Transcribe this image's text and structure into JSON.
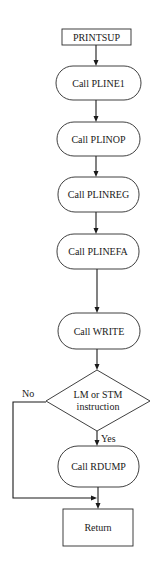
{
  "diagram": {
    "type": "flowchart",
    "nodes": {
      "start": {
        "label": "PRINTSUP",
        "shape": "rectangle"
      },
      "pline1": {
        "label": "Call PLINE1",
        "shape": "rounded"
      },
      "plinop": {
        "label": "Call PLINOP",
        "shape": "rounded"
      },
      "plinreg": {
        "label": "Call PLINREG",
        "shape": "rounded"
      },
      "plinefa": {
        "label": "Call PLINEFA",
        "shape": "rounded"
      },
      "write": {
        "label": "Call WRITE",
        "shape": "rounded"
      },
      "decision": {
        "label_line1": "LM or STM",
        "label_line2": "instruction",
        "shape": "diamond"
      },
      "rdump": {
        "label": "Call RDUMP",
        "shape": "rounded"
      },
      "return": {
        "label": "Return",
        "shape": "rectangle"
      }
    },
    "edge_labels": {
      "no": "No",
      "yes": "Yes"
    },
    "edges": [
      {
        "from": "start",
        "to": "pline1"
      },
      {
        "from": "pline1",
        "to": "plinop"
      },
      {
        "from": "plinop",
        "to": "plinreg"
      },
      {
        "from": "plinreg",
        "to": "plinefa"
      },
      {
        "from": "plinefa",
        "to": "write"
      },
      {
        "from": "write",
        "to": "decision"
      },
      {
        "from": "decision",
        "to": "rdump",
        "label": "Yes"
      },
      {
        "from": "decision",
        "to": "return",
        "label": "No"
      },
      {
        "from": "rdump",
        "to": "return"
      }
    ]
  }
}
